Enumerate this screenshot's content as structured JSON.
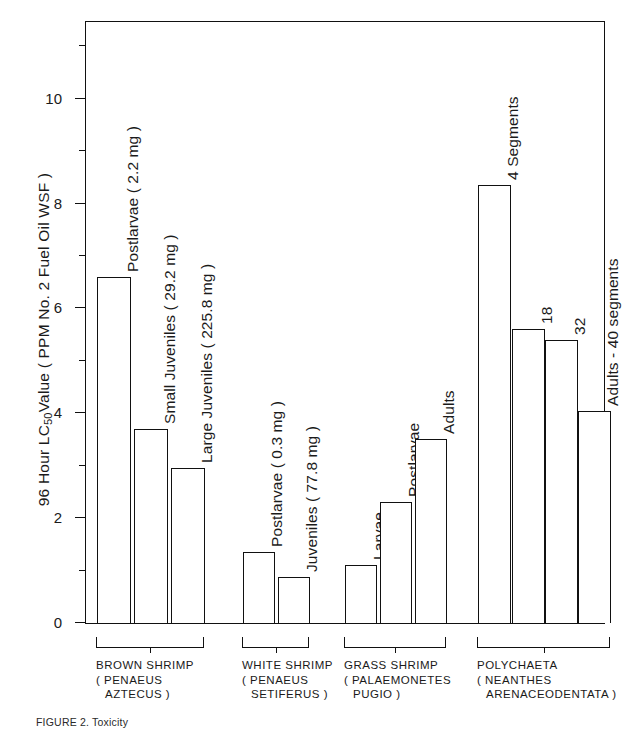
{
  "chart_data": {
    "type": "bar",
    "title": "",
    "ylabel": "96 Hour LC50 Value ( PPM No. 2 Fuel Oil WSF )",
    "ylabel_pre": "96 Hour LC",
    "ylabel_sub": "50",
    "ylabel_post": "Value ( PPM No. 2 Fuel Oil WSF )",
    "xlabel": "",
    "ylim": [
      0,
      11.5
    ],
    "grid": false,
    "legend": "none",
    "ytick_labels": [
      "0",
      "2",
      "4",
      "6",
      "8",
      "10"
    ],
    "ytick_values": [
      0,
      2,
      4,
      6,
      8,
      10
    ],
    "yminor_values": [
      1,
      3,
      5,
      7,
      9,
      11
    ],
    "groups": [
      {
        "name": "BROWN SHRIMP",
        "species_line1": "( PENAEUS",
        "species_line2": "AZTECUS )",
        "bars": [
          {
            "label": "Postlarvae ( 2.2 mg )",
            "value": 6.6
          },
          {
            "label": "Small Juveniles ( 29.2 mg )",
            "value": 3.7
          },
          {
            "label": "Large Juveniles ( 225.8 mg )",
            "value": 2.95
          }
        ]
      },
      {
        "name": "WHITE SHRIMP",
        "species_line1": "( PENAEUS",
        "species_line2": "SETIFERUS )",
        "bars": [
          {
            "label": "Postlarvae ( 0.3 mg )",
            "value": 1.35
          },
          {
            "label": "Juveniles ( 77.8 mg )",
            "value": 0.88
          }
        ]
      },
      {
        "name": "GRASS SHRIMP",
        "species_line1": "( PALAEMONETES",
        "species_line2": "PUGIO )",
        "bars": [
          {
            "label": "Larvae",
            "value": 1.1
          },
          {
            "label": "Postlarvae",
            "value": 2.3
          },
          {
            "label": "Adults",
            "value": 3.5
          }
        ]
      },
      {
        "name": "POLYCHAETA",
        "species_line1": "( NEANTHES",
        "species_line2": "ARENACEODENTATA )",
        "bars": [
          {
            "label": "4 Segments",
            "value": 8.35
          },
          {
            "label": "18",
            "value": 5.6
          },
          {
            "label": "32",
            "value": 5.4
          },
          {
            "label": "Adults - 40 segments",
            "value": 4.05
          }
        ]
      }
    ]
  },
  "caption": "FIGURE  2.  Toxicity"
}
